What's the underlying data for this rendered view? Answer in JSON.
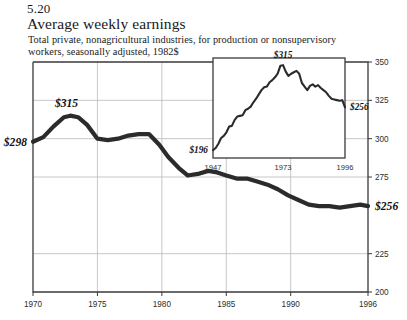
{
  "header": {
    "figure_number": "5.20",
    "title": "Average weekly earnings",
    "subtitle": "Total private, nonagricultural industries, for production or nonsupervisory workers, seasonally adjusted, 1982$"
  },
  "chart_data": {
    "type": "line",
    "title": "Average weekly earnings",
    "subtitle": "Total private, nonagricultural industries, for production or nonsupervisory workers, seasonally adjusted, 1982$",
    "xlabel": "",
    "ylabel": "",
    "xlim": [
      1970,
      1996
    ],
    "ylim": [
      200,
      350
    ],
    "grid": true,
    "y_ticks": [
      "350",
      "325",
      "300",
      "275",
      "225",
      "200"
    ],
    "y_tick_values": [
      350,
      325,
      300,
      275,
      225,
      200
    ],
    "x_ticks": [
      "1970",
      "1975",
      "1980",
      "1985",
      "1990",
      "1996"
    ],
    "x_tick_values": [
      1970,
      1975,
      1980,
      1985,
      1990,
      1996
    ],
    "axis_position": "right",
    "annotations": [
      {
        "text": "$298",
        "x": 1970,
        "y": 298,
        "position": "left"
      },
      {
        "text": "$315",
        "x": 1972.6,
        "y": 315,
        "position": "above"
      },
      {
        "text": "$256",
        "x": 1996,
        "y": 256,
        "position": "right"
      }
    ],
    "series": [
      {
        "name": "Average weekly earnings (1982$)",
        "x": [
          1970,
          1970.8,
          1971.6,
          1972.4,
          1972.9,
          1973.5,
          1974.2,
          1975.0,
          1975.8,
          1976.6,
          1977.4,
          1978.2,
          1979.0,
          1979.8,
          1980.5,
          1981.3,
          1982.0,
          1982.8,
          1983.6,
          1984.3,
          1985.0,
          1985.8,
          1986.6,
          1987.4,
          1988.2,
          1989.0,
          1989.8,
          1990.6,
          1991.4,
          1992.2,
          1993.0,
          1993.8,
          1994.6,
          1995.4,
          1996.0
        ],
        "values": [
          298,
          301,
          308,
          314,
          315,
          314,
          309,
          300,
          299,
          300,
          302,
          303,
          303,
          296,
          288,
          281,
          276,
          277,
          279,
          278,
          276,
          274,
          274,
          272,
          270,
          267,
          263,
          260,
          257,
          256,
          256,
          255,
          256,
          257,
          256
        ],
        "color": "#2b2b2b",
        "linewidth": 4.2
      }
    ]
  },
  "inset_chart_data": {
    "type": "line",
    "xlim": [
      1947,
      1996
    ],
    "ylim": [
      185,
      325
    ],
    "grid": false,
    "x_ticks": [
      "1947",
      "1973",
      "1996"
    ],
    "x_tick_values": [
      1947,
      1973,
      1996
    ],
    "annotations": [
      {
        "text": "$196",
        "x": 1947,
        "y": 196,
        "position": "left"
      },
      {
        "text": "$315",
        "x": 1973,
        "y": 315,
        "position": "above"
      },
      {
        "text": "$256",
        "x": 1996,
        "y": 256,
        "position": "right"
      }
    ],
    "series": [
      {
        "name": "Average weekly earnings (1982$), long run",
        "x": [
          1947,
          1948,
          1949,
          1950,
          1951,
          1952,
          1953,
          1954,
          1955,
          1956,
          1957,
          1958,
          1959,
          1960,
          1961,
          1962,
          1963,
          1964,
          1965,
          1966,
          1967,
          1968,
          1969,
          1970,
          1971,
          1972,
          1973,
          1974,
          1975,
          1976,
          1977,
          1978,
          1979,
          1980,
          1981,
          1982,
          1983,
          1984,
          1985,
          1986,
          1987,
          1988,
          1989,
          1990,
          1991,
          1992,
          1993,
          1994,
          1995,
          1996
        ],
        "values": [
          196,
          199,
          205,
          213,
          216,
          221,
          229,
          230,
          238,
          243,
          244,
          245,
          252,
          254,
          257,
          263,
          268,
          274,
          280,
          284,
          285,
          291,
          294,
          298,
          303,
          314,
          315,
          306,
          300,
          303,
          305,
          307,
          303,
          290,
          285,
          280,
          286,
          288,
          285,
          287,
          283,
          280,
          277,
          272,
          268,
          267,
          266,
          265,
          266,
          256
        ],
        "color": "#2b2b2b",
        "linewidth": 2.1
      }
    ]
  }
}
